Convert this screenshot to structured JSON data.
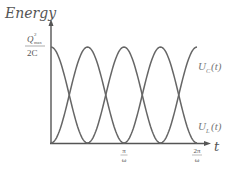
{
  "chart_data": {
    "type": "line",
    "title": "",
    "ylabel": "Energy",
    "xlabel": "t",
    "y_tick_label": {
      "numerator": "Q",
      "sup": "2",
      "sub": "max",
      "denominator": "2C"
    },
    "x_ticks": [
      {
        "value": "pi/omega",
        "numerator": "π",
        "denominator": "ω"
      },
      {
        "value": "2pi/omega",
        "numerator": "2π",
        "denominator": "ω"
      }
    ],
    "xlim": [
      "0",
      "2π/ω"
    ],
    "ylim": [
      0,
      "Q²max/2C"
    ],
    "grid": false,
    "series": [
      {
        "name": "U_C(t)",
        "label_main": "U",
        "label_sub": "C",
        "label_tail": "(t)",
        "function": "(Q²max/2C)·cos²(ωt)",
        "x": [
          "0",
          "π/2ω",
          "π/ω",
          "3π/2ω",
          "2π/ω"
        ],
        "values": [
          1,
          0,
          1,
          0,
          1
        ]
      },
      {
        "name": "U_L(t)",
        "label_main": "U",
        "label_sub": "L",
        "label_tail": "(t)",
        "function": "(Q²max/2C)·sin²(ωt)",
        "x": [
          "0",
          "π/2ω",
          "π/ω",
          "3π/2ω",
          "2π/ω"
        ],
        "values": [
          0,
          1,
          0,
          1,
          0
        ]
      }
    ],
    "colors": {
      "axis": "#555555",
      "curve": "#666666",
      "text": "#555555"
    }
  }
}
